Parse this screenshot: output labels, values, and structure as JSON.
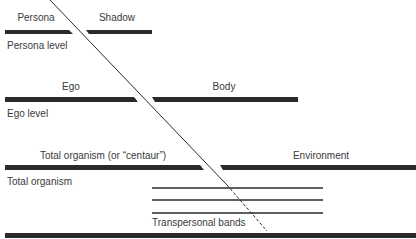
{
  "diagram": {
    "type": "spectrum-of-consciousness",
    "ink_color": "#2a2a2a",
    "levels": [
      {
        "id": "persona",
        "level_label": "Persona level",
        "left_label": "Persona",
        "right_label": "Shadow"
      },
      {
        "id": "ego",
        "level_label": "Ego level",
        "left_label": "Ego",
        "right_label": "Body"
      },
      {
        "id": "total-organism",
        "level_label": "Total organism",
        "left_label": "Total organism (or “centaur”)",
        "right_label": "Environment"
      }
    ],
    "transpersonal": {
      "label": "Transpersonal bands",
      "band_count": 3
    },
    "dividing_line": {
      "style_upper": "solid",
      "style_lower": "dashed"
    }
  }
}
